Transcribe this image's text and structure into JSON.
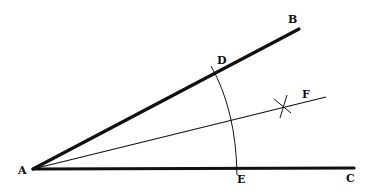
{
  "diagram": {
    "colors": {
      "stroke": "#111111",
      "background": "#ffffff"
    },
    "points": {
      "A": {
        "label": "A",
        "x": 33,
        "y": 169
      },
      "B": {
        "label": "B",
        "x": 299,
        "y": 29
      },
      "C": {
        "label": "C",
        "x": 354,
        "y": 168
      },
      "D": {
        "label": "D",
        "x": 214,
        "y": 74
      },
      "E": {
        "label": "E",
        "x": 236,
        "y": 168
      },
      "F": {
        "label": "F",
        "x": 326,
        "y": 97
      }
    },
    "segments": [
      {
        "name": "ray-AB",
        "from": "A",
        "to": "B",
        "weight": "thick"
      },
      {
        "name": "ray-AC",
        "from": "A",
        "to": "C",
        "weight": "thick"
      },
      {
        "name": "bisector-AF",
        "from": "A",
        "to": "F",
        "weight": "thin"
      }
    ],
    "arc": {
      "name": "arc-DE",
      "center": "A",
      "through": [
        "D",
        "E"
      ]
    },
    "cross_mark": {
      "name": "arc-intersection-x",
      "x": 284,
      "y": 107
    }
  }
}
